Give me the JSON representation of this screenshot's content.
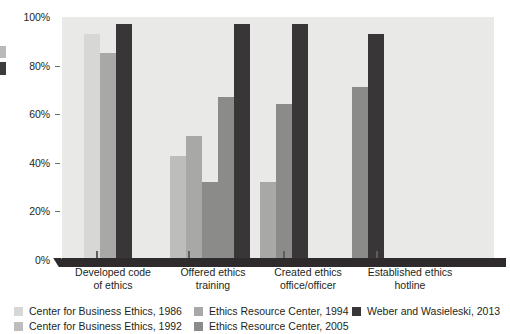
{
  "chart_data": {
    "type": "bar",
    "title": "",
    "subtitle": "",
    "xlabel": "",
    "ylabel": "",
    "ylim": [
      0,
      100
    ],
    "ytick_labels": [
      "100%",
      "80%",
      "60%",
      "40%",
      "20%",
      "0%"
    ],
    "ytick_values": [
      100,
      80,
      60,
      40,
      20,
      0
    ],
    "grid": false,
    "legend_position": "bottom",
    "categories": [
      "Developed code of ethics",
      "Offered ethics training",
      "Created ethics office/officer",
      "Established ethics hotline"
    ],
    "category_lines": [
      [
        "Developed code",
        "of ethics"
      ],
      [
        "Offered ethics",
        "training"
      ],
      [
        "Created ethics",
        "office/officer"
      ],
      [
        "Established ethics",
        "hotline"
      ]
    ],
    "series": [
      {
        "name": "Center for Business Ethics, 1986",
        "color": "#d7d7d5",
        "values": [
          93,
          null,
          null,
          null
        ]
      },
      {
        "name": "Center for Business Ethics, 1992",
        "color": "#bdbdbb",
        "values": [
          null,
          43,
          null,
          null
        ]
      },
      {
        "name": "Ethics Resource Center, 1994",
        "color": "#a8a8a6",
        "values": [
          85,
          51,
          32,
          null
        ]
      },
      {
        "name": "Ethics Resource Center, 2005",
        "color": "#8b8b89",
        "values": [
          null,
          32,
          64,
          71
        ]
      },
      {
        "name": "Weber and  Wasieleski, 2013",
        "color": "#393637",
        "values": [
          97,
          97,
          97,
          93
        ]
      }
    ],
    "extra_bars": [
      {
        "category_index": 1,
        "series_name": "Ethics Resource Center, 2005",
        "value": 67,
        "color": "#8b8b89"
      }
    ]
  },
  "legend": {
    "columns": [
      [
        {
          "label": "Center for Business Ethics, 1986",
          "color": "#d7d7d5"
        },
        {
          "label": "Center for Business Ethics, 1992",
          "color": "#bdbdbb"
        }
      ],
      [
        {
          "label": "Ethics Resource Center, 1994",
          "color": "#a8a8a6"
        },
        {
          "label": "Ethics Resource Center, 2005",
          "color": "#8b8b89"
        }
      ],
      [
        {
          "label": "Weber and  Wasieleski, 2013",
          "color": "#393637"
        }
      ]
    ]
  },
  "colors": {
    "plot_background": "#e9e9e7",
    "baseline": "#2f2b2c",
    "text": "#231f20",
    "tick": "#6d6d6d"
  }
}
